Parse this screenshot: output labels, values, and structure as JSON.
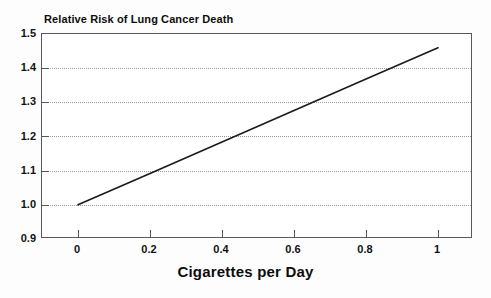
{
  "chart_data": {
    "type": "line",
    "title": "Relative Risk of Lung Cancer Death",
    "xlabel": "Cigarettes per Day",
    "ylabel": "",
    "xlim": [
      -0.105,
      0.48
    ],
    "ylim": [
      0.9,
      1.5
    ],
    "xticks": [
      "0",
      "0.2",
      "0.4",
      "0.6",
      "0.8",
      "1"
    ],
    "xtick_values": [
      0,
      0.2,
      0.4,
      0.6,
      0.8,
      1
    ],
    "yticks": [
      "0.9",
      "1.0",
      "1.1",
      "1.2",
      "1.3",
      "1.4",
      "1.5"
    ],
    "ytick_values": [
      0.9,
      1.0,
      1.1,
      1.2,
      1.3,
      1.4,
      1.5
    ],
    "grid": "horizontal-dotted",
    "legend": null,
    "series": [
      {
        "name": "Relative Risk of Lung Cancer Death",
        "x": [
          0,
          0.2,
          0.4,
          0.6,
          0.8,
          1
        ],
        "values": [
          1.0,
          1.092,
          1.184,
          1.276,
          1.368,
          1.46
        ],
        "color": "#1a1a1a"
      }
    ]
  },
  "axes": {
    "y_tick_labels": [
      "1.5",
      "1.4",
      "1.3",
      "1.2",
      "1.1",
      "1.0",
      "0.9"
    ],
    "x_tick_labels": [
      "0",
      "0.2",
      "0.4",
      "0.6",
      "0.8",
      "1"
    ]
  },
  "colors": {
    "line": "#1a1a1a",
    "frame": "#58585c",
    "grid": "#9a9a9e",
    "background": "#fdfdfd",
    "text": "#111111"
  }
}
